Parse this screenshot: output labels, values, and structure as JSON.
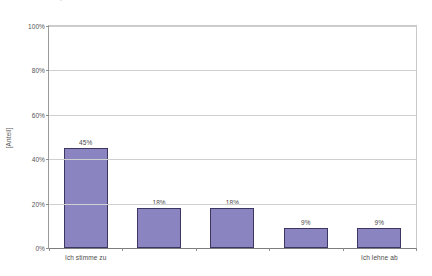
{
  "title": {
    "text": "Repräsentativ oder nicht"
  },
  "chart_data": {
    "type": "bar",
    "title": "Repräsentativ oder nicht",
    "xlabel": "",
    "ylabel": "[Anteil]",
    "ylim": [
      0,
      100
    ],
    "yticks": [
      "0%",
      "20%",
      "40%",
      "60%",
      "80%",
      "100%"
    ],
    "ytick_values": [
      0,
      20,
      40,
      60,
      80,
      100
    ],
    "grid": true,
    "legend": false,
    "categories": [
      "Ich stimme zu",
      "",
      "",
      "",
      "Ich lehne ab"
    ],
    "values": [
      45,
      18,
      18,
      9,
      9
    ],
    "data_labels": [
      "45%",
      "18%",
      "18%",
      "9%",
      "9%"
    ],
    "bar_color": "#8a84c0",
    "bar_border_color": "#3d3663",
    "grid_color": "#cfcfcf",
    "axis_color": "#8d8d8d"
  }
}
